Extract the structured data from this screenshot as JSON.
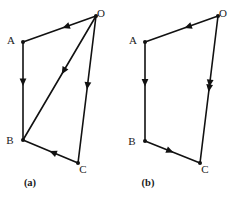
{
  "figure": {
    "type": "vector-diagram",
    "stroke_color": "#111111",
    "background_color": "#ffffff",
    "width": 236,
    "height": 199
  },
  "panels": [
    {
      "id": "a",
      "caption": "(a)",
      "caption_pos": {
        "x": 30,
        "y": 186
      },
      "vertices": [
        {
          "name": "O",
          "label": "O",
          "x": 96,
          "y": 16,
          "label_x": 101,
          "label_y": 14
        },
        {
          "name": "A",
          "label": "A",
          "x": 23,
          "y": 42,
          "label_x": 11,
          "label_y": 41
        },
        {
          "name": "B",
          "label": "B",
          "x": 23,
          "y": 140,
          "label_x": 10,
          "label_y": 141
        },
        {
          "name": "C",
          "label": "C",
          "x": 78,
          "y": 163,
          "label_x": 83,
          "label_y": 170
        }
      ],
      "edges": [
        {
          "name": "edge-O-A",
          "from": "O",
          "to": "A",
          "arrow_at": 0.46,
          "arrow_count": 1
        },
        {
          "name": "edge-A-B",
          "from": "A",
          "to": "B",
          "arrow_at": 0.45,
          "arrow_count": 1
        },
        {
          "name": "edge-O-B",
          "from": "O",
          "to": "B",
          "arrow_at": 0.47,
          "arrow_count": 1
        },
        {
          "name": "edge-O-C",
          "from": "O",
          "to": "C",
          "arrow_at": 0.5,
          "arrow_count": 1
        },
        {
          "name": "edge-C-B",
          "from": "C",
          "to": "B",
          "arrow_at": 0.52,
          "arrow_count": 1
        }
      ]
    },
    {
      "id": "b",
      "caption": "(b)",
      "caption_pos": {
        "x": 148,
        "y": 186
      },
      "vertices": [
        {
          "name": "O",
          "label": "O",
          "x": 218,
          "y": 16,
          "label_x": 223,
          "label_y": 14
        },
        {
          "name": "A",
          "label": "A",
          "x": 145,
          "y": 42,
          "label_x": 133,
          "label_y": 41
        },
        {
          "name": "B",
          "label": "B",
          "x": 145,
          "y": 141,
          "label_x": 132,
          "label_y": 142
        },
        {
          "name": "C",
          "label": "C",
          "x": 200,
          "y": 163,
          "label_x": 205,
          "label_y": 170
        }
      ],
      "edges": [
        {
          "name": "edge-O-A",
          "from": "O",
          "to": "A",
          "arrow_at": 0.46,
          "arrow_count": 1
        },
        {
          "name": "edge-A-B",
          "from": "A",
          "to": "B",
          "arrow_at": 0.45,
          "arrow_count": 1
        },
        {
          "name": "edge-O-C",
          "from": "O",
          "to": "C",
          "arrow_at": 0.5,
          "arrow_count": 2
        },
        {
          "name": "edge-B-C",
          "from": "B",
          "to": "C",
          "arrow_at": 0.52,
          "arrow_count": 1
        }
      ]
    }
  ],
  "style": {
    "arrow_length": 7.5,
    "arrow_half_width": 3.4,
    "vertex_dot_radius": 2.0,
    "double_arrow_gap": 5.0
  }
}
